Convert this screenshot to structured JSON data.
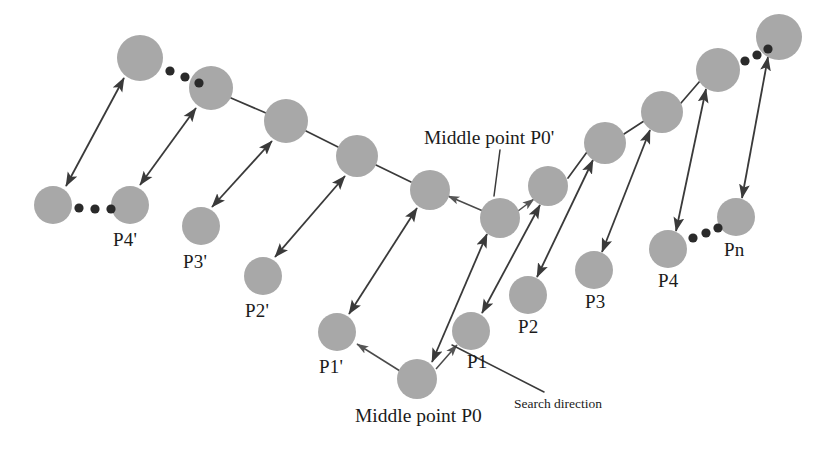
{
  "figure": {
    "type": "diagram",
    "background_color": "#ffffff",
    "node_fill_color": "#a8a8a8",
    "line_color": "#3a3a3a",
    "text_color": "#1b1b1b"
  },
  "labels": {
    "middle_point_top": "Middle point P0'",
    "middle_point_bottom": "Middle point P0",
    "search_direction": "Search direction",
    "p1_prime": "P1'",
    "p2_prime": "P2'",
    "p3_prime": "P3'",
    "p4_prime": "P4'",
    "p1": "P1",
    "p2": "P2",
    "p3": "P3",
    "p4": "P4",
    "pn": "Pn"
  },
  "nodes": {
    "lower_left_chain": [
      {
        "id": "p0-prime-far",
        "cx": 53,
        "cy": 205,
        "r": 19,
        "label": ""
      },
      {
        "id": "p4-prime",
        "cx": 130,
        "cy": 205,
        "r": 19,
        "label": "P4'"
      },
      {
        "id": "p3-prime",
        "cx": 201,
        "cy": 226,
        "r": 19,
        "label": "P3'"
      },
      {
        "id": "p2-prime",
        "cx": 263,
        "cy": 276,
        "r": 19,
        "label": "P2'"
      },
      {
        "id": "p1-prime",
        "cx": 337,
        "cy": 332,
        "r": 19,
        "label": "P1'"
      },
      {
        "id": "p0",
        "cx": 417,
        "cy": 379,
        "r": 20,
        "label": "Middle point P0"
      }
    ],
    "lower_right_chain": [
      {
        "id": "p1",
        "cx": 471,
        "cy": 331,
        "r": 19,
        "label": "P1"
      },
      {
        "id": "p2",
        "cx": 528,
        "cy": 295,
        "r": 19,
        "label": "P2"
      },
      {
        "id": "p3",
        "cx": 594,
        "cy": 270,
        "r": 19,
        "label": "P3"
      },
      {
        "id": "p4",
        "cx": 668,
        "cy": 249,
        "r": 19,
        "label": "P4"
      },
      {
        "id": "pn",
        "cx": 736,
        "cy": 217,
        "r": 19,
        "label": "Pn"
      }
    ],
    "upper_chain": [
      {
        "id": "u-far-left",
        "cx": 140,
        "cy": 58,
        "r": 23,
        "label": ""
      },
      {
        "id": "u-2",
        "cx": 211,
        "cy": 88,
        "r": 22,
        "label": ""
      },
      {
        "id": "u-3",
        "cx": 286,
        "cy": 121,
        "r": 22,
        "label": ""
      },
      {
        "id": "u-4",
        "cx": 357,
        "cy": 156,
        "r": 21,
        "label": ""
      },
      {
        "id": "u-5",
        "cx": 430,
        "cy": 190,
        "r": 20,
        "label": ""
      },
      {
        "id": "p0-prime",
        "cx": 500,
        "cy": 218,
        "r": 20,
        "label": "Middle point P0'"
      },
      {
        "id": "u-7",
        "cx": 548,
        "cy": 186,
        "r": 20,
        "label": ""
      },
      {
        "id": "u-8",
        "cx": 605,
        "cy": 143,
        "r": 21,
        "label": ""
      },
      {
        "id": "u-9",
        "cx": 662,
        "cy": 112,
        "r": 21,
        "label": ""
      },
      {
        "id": "u-10",
        "cx": 718,
        "cy": 70,
        "r": 22,
        "label": ""
      },
      {
        "id": "u-11",
        "cx": 779,
        "cy": 37,
        "r": 23,
        "label": ""
      }
    ]
  },
  "ellipses": [
    {
      "id": "ellipsis-lower-left",
      "points": [
        [
          79,
          208
        ],
        [
          95,
          209
        ],
        [
          111,
          209
        ]
      ]
    },
    {
      "id": "ellipsis-upper-left",
      "points": [
        [
          170,
          71
        ],
        [
          185,
          77
        ],
        [
          199,
          82
        ]
      ]
    },
    {
      "id": "ellipsis-lower-right",
      "points": [
        [
          693,
          237
        ],
        [
          706,
          232
        ],
        [
          718,
          227
        ]
      ]
    },
    {
      "id": "ellipsis-upper-right",
      "points": [
        [
          745,
          60
        ],
        [
          757,
          54
        ],
        [
          768,
          48
        ]
      ]
    }
  ]
}
